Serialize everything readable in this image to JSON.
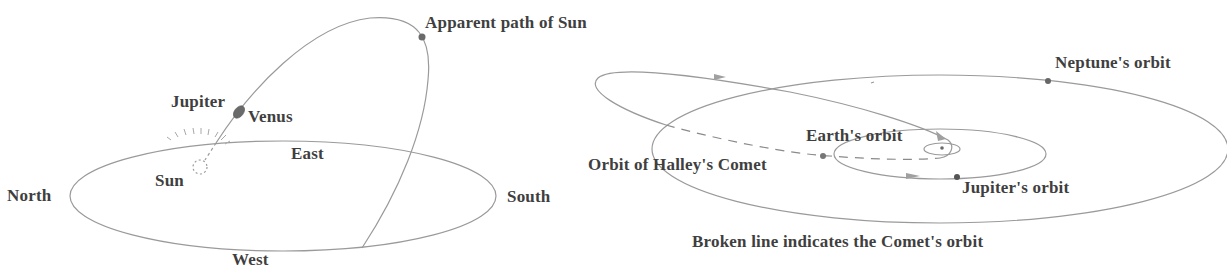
{
  "sky_diagram": {
    "labels": {
      "apparent_path": "Apparent path of Sun",
      "jupiter": "Jupiter",
      "venus": "Venus",
      "east": "East",
      "sun": "Sun",
      "north": "North",
      "south": "South",
      "west": "West"
    },
    "colors": {
      "line": "#9a9a9a",
      "planet_fill": "#6a6a6a",
      "text": "#3f3f3f"
    }
  },
  "orbit_diagram": {
    "labels": {
      "neptune_orbit": "Neptune's orbit",
      "earth_orbit": "Earth's orbit",
      "halley_orbit": "Orbit of Halley's Comet",
      "jupiter_orbit": "Jupiter's orbit",
      "caption": "Broken line indicates the Comet's orbit"
    },
    "colors": {
      "line": "#9a9a9a",
      "dash": "#8a8a8a",
      "planet_fill": "#6a6a6a",
      "arrow_fill": "#a0a0a0",
      "text": "#3f3f3f"
    }
  }
}
